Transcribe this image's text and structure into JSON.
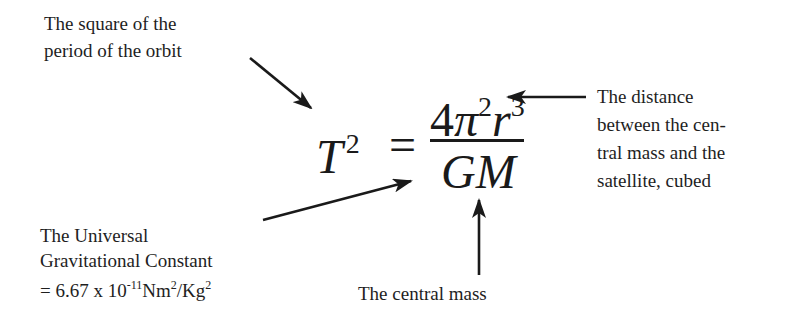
{
  "equation": {
    "lhs_base": "T",
    "lhs_exponent": "2",
    "equals": "=",
    "numerator": {
      "coefficient": "4",
      "pi": "π",
      "pi_exponent": "2",
      "r": "r",
      "r_exponent": "3"
    },
    "denominator": "GM"
  },
  "labels": {
    "period": {
      "lines": [
        "The square of the",
        "period of the orbit"
      ]
    },
    "distance": {
      "lines": [
        "The distance",
        "between the cen-",
        "tral mass and the",
        "satellite, cubed"
      ]
    },
    "constant": {
      "line1": "The Universal",
      "line2": "Gravitational Constant",
      "line3_prefix": "= 6.67 x 10",
      "line3_exp": "-11",
      "line3_unit1": "Nm",
      "line3_unit1_exp": "2",
      "line3_sep": "/Kg",
      "line3_unit2_exp": "2"
    },
    "mass": {
      "text": "The central mass"
    }
  },
  "colors": {
    "ink": "#1e1e1e",
    "background": "#ffffff"
  }
}
